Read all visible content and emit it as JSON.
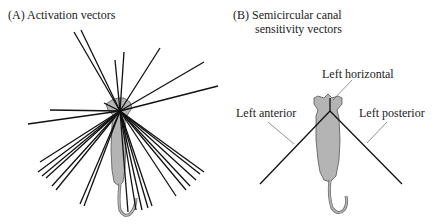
{
  "panels": {
    "a": {
      "title": "(A)  Activation vectors"
    },
    "b": {
      "title_line1": "(B)  Semicircular canal",
      "title_line2": "sensitivity vectors",
      "labels": {
        "horizontal": "Left horizontal",
        "anterior": "Left anterior",
        "posterior": "Left posterior"
      }
    }
  },
  "colors": {
    "cat_fill": "#b4b4b4",
    "cat_stroke": "#555555",
    "vector": "#111111",
    "leader": "#666666"
  }
}
